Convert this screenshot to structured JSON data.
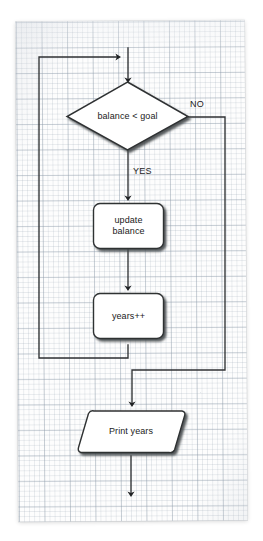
{
  "diagram": {
    "medium": "graph-paper",
    "stroke_color": "#2f3133",
    "fill_color": "#ffffff",
    "shadow_color": "#5b5f63",
    "nodes": [
      {
        "id": "decision",
        "shape": "diamond",
        "label": "balance < goal"
      },
      {
        "id": "update",
        "shape": "rounded-rect",
        "label": "update\nbalance"
      },
      {
        "id": "increment",
        "shape": "rounded-rect",
        "label": "years++"
      },
      {
        "id": "output",
        "shape": "parallelogram",
        "label": "Print years"
      }
    ],
    "edge_labels": [
      {
        "id": "no",
        "label": "NO"
      },
      {
        "id": "yes",
        "label": "YES"
      }
    ]
  }
}
